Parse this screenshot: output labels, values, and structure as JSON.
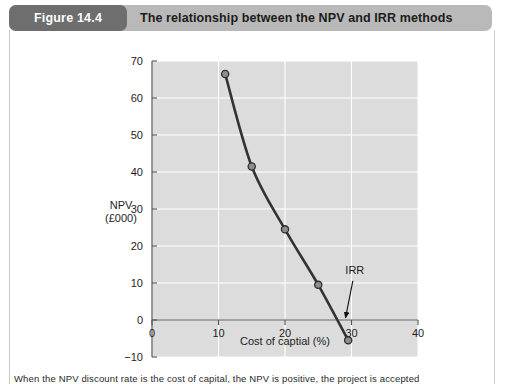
{
  "header": {
    "figure_number": "Figure 14.4",
    "title": "The relationship between the NPV and IRR methods",
    "pill_color": "#6e6e6e",
    "bar_color": "#b9b9b9"
  },
  "caption": {
    "text": "When the NPV discount rate is the cost of capital, the NPV is positive, the project is accepted"
  },
  "chart_data": {
    "type": "line",
    "title": "The relationship between the NPV and IRR methods",
    "xlabel": "Cost of captial (%)",
    "ylabel": "NPV (£000)",
    "ylabel_lines": [
      "NPV",
      "(£000)"
    ],
    "xlim": [
      0,
      40
    ],
    "ylim": [
      -10,
      70
    ],
    "xticks": [
      0,
      10,
      20,
      30,
      40
    ],
    "yticks": [
      -10,
      0,
      10,
      20,
      30,
      40,
      50,
      60,
      70
    ],
    "xtick_labels": [
      "0",
      "10",
      "20",
      "30",
      "40"
    ],
    "ytick_labels": [
      "−10",
      "0",
      "10",
      "20",
      "30",
      "40",
      "50",
      "60",
      "70"
    ],
    "grid": true,
    "grid_color": "#ffffff",
    "plot_bg": "#dcdcdc",
    "legend": null,
    "series": [
      {
        "name": "NPV profile",
        "marker": "circle",
        "line_color": "#333333",
        "marker_fill": "#8d8d8d",
        "x": [
          11,
          15,
          20,
          25,
          29.5
        ],
        "y": [
          66.5,
          41.5,
          24.5,
          9.5,
          -5.5
        ]
      }
    ],
    "annotations": [
      {
        "label": "IRR",
        "label_x": 30.5,
        "label_y": 12.5,
        "arrow_from_x": 30.2,
        "arrow_from_y": 10.6,
        "arrow_to_x": 29.1,
        "arrow_to_y": 0.6
      }
    ]
  }
}
